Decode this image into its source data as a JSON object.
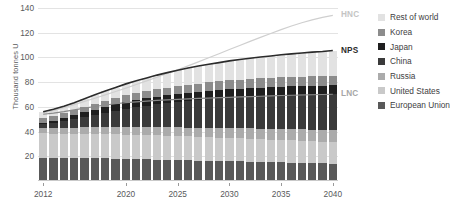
{
  "chart_data": {
    "type": "bar",
    "title": "",
    "subtitle": "",
    "xlabel": "",
    "ylabel": "Thousand tonnes U",
    "ylim": [
      0,
      140
    ],
    "ytick_values": [
      20,
      40,
      60,
      80,
      100,
      120,
      140
    ],
    "ytick_labels": [
      "20",
      "40",
      "60",
      "80",
      "100",
      "120",
      "140"
    ],
    "grid": true,
    "stacked": true,
    "legend_position": "right",
    "x": [
      2012,
      2013,
      2014,
      2015,
      2016,
      2017,
      2018,
      2019,
      2020,
      2021,
      2022,
      2023,
      2024,
      2025,
      2026,
      2027,
      2028,
      2029,
      2030,
      2031,
      2032,
      2033,
      2034,
      2035,
      2036,
      2037,
      2038,
      2039,
      2040
    ],
    "xtick_values": [
      2012,
      2020,
      2025,
      2030,
      2035,
      2040
    ],
    "xtick_labels": [
      "2012",
      "2020",
      "2025",
      "2030",
      "2035",
      "2040"
    ],
    "categories": [
      "2012",
      "2013",
      "2014",
      "2015",
      "2016",
      "2017",
      "2018",
      "2019",
      "2020",
      "2021",
      "2022",
      "2023",
      "2024",
      "2025",
      "2026",
      "2027",
      "2028",
      "2029",
      "2030",
      "2031",
      "2032",
      "2033",
      "2034",
      "2035",
      "2036",
      "2037",
      "2038",
      "2039",
      "2040"
    ],
    "series": [
      {
        "name": "European Union",
        "color": "#595959",
        "values": [
          19.0,
          18.9,
          18.8,
          18.7,
          18.6,
          18.5,
          18.4,
          18.2,
          18.0,
          17.8,
          17.6,
          17.4,
          17.2,
          17.0,
          16.8,
          16.6,
          16.4,
          16.2,
          16.0,
          15.8,
          15.6,
          15.4,
          15.2,
          15.0,
          14.8,
          14.6,
          14.4,
          14.2,
          14.0
        ]
      },
      {
        "name": "United States",
        "color": "#c9c9c9",
        "values": [
          19.5,
          19.5,
          19.5,
          19.5,
          19.6,
          19.6,
          19.6,
          19.6,
          19.6,
          19.6,
          19.5,
          19.5,
          19.4,
          19.4,
          19.3,
          19.2,
          19.1,
          19.0,
          18.9,
          18.8,
          18.6,
          18.5,
          18.3,
          18.2,
          18.0,
          17.9,
          17.7,
          17.6,
          17.4
        ]
      },
      {
        "name": "Russia",
        "color": "#ababab",
        "values": [
          4.6,
          4.7,
          4.8,
          5.0,
          5.2,
          5.4,
          5.6,
          5.8,
          6.0,
          6.2,
          6.4,
          6.6,
          6.8,
          7.0,
          7.2,
          7.4,
          7.6,
          7.8,
          8.0,
          8.2,
          8.4,
          8.6,
          8.8,
          9.0,
          9.2,
          9.4,
          9.6,
          9.8,
          10.0
        ]
      },
      {
        "name": "China",
        "color": "#3a3a3a",
        "values": [
          3.0,
          4.2,
          5.5,
          7.0,
          8.6,
          10.2,
          11.8,
          13.4,
          15.0,
          16.4,
          17.6,
          18.8,
          19.8,
          20.8,
          21.7,
          22.5,
          23.3,
          24.0,
          24.7,
          25.3,
          25.9,
          26.4,
          26.9,
          27.4,
          27.8,
          28.2,
          28.6,
          28.9,
          29.2
        ]
      },
      {
        "name": "Japan",
        "color": "#1f1f1f",
        "values": [
          1.2,
          1.6,
          2.2,
          2.9,
          3.5,
          4.1,
          4.6,
          5.0,
          5.4,
          5.7,
          5.9,
          6.1,
          6.3,
          6.4,
          6.5,
          6.6,
          6.7,
          6.7,
          6.8,
          6.8,
          6.8,
          6.8,
          6.8,
          6.8,
          6.8,
          6.8,
          6.8,
          6.8,
          6.8
        ]
      },
      {
        "name": "Korea",
        "color": "#8c8c8c",
        "values": [
          3.9,
          4.0,
          4.1,
          4.3,
          4.5,
          4.7,
          4.9,
          5.1,
          5.3,
          5.5,
          5.7,
          5.9,
          6.1,
          6.3,
          6.5,
          6.6,
          6.8,
          6.9,
          7.0,
          7.1,
          7.2,
          7.3,
          7.4,
          7.5,
          7.6,
          7.7,
          7.8,
          7.9,
          8.0
        ]
      },
      {
        "name": "Rest of world",
        "color": "#e2e2e2",
        "values": [
          4.8,
          5.1,
          5.5,
          6.0,
          6.6,
          7.2,
          7.9,
          8.6,
          9.3,
          10.0,
          10.7,
          11.4,
          12.1,
          12.8,
          13.4,
          14.0,
          14.6,
          15.2,
          15.8,
          16.3,
          16.8,
          17.3,
          17.8,
          18.3,
          18.7,
          19.1,
          19.5,
          19.9,
          20.2
        ]
      }
    ],
    "lines": [
      {
        "name": "HNC",
        "label": "HNC",
        "color": "#cfcfcf",
        "values": [
          55.0,
          57.0,
          59.3,
          61.8,
          64.4,
          67.0,
          69.7,
          72.4,
          75.2,
          78.1,
          81.0,
          84.0,
          87.0,
          90.0,
          93.2,
          96.4,
          99.7,
          103.0,
          106.4,
          109.7,
          113.0,
          116.2,
          119.4,
          122.5,
          125.4,
          128.1,
          130.4,
          132.4,
          134.0
        ]
      },
      {
        "name": "NPS",
        "label": "NPS",
        "color": "#2b2b2b",
        "values": [
          56.0,
          58.0,
          60.4,
          63.4,
          66.6,
          69.7,
          72.8,
          75.7,
          78.6,
          81.2,
          83.4,
          85.7,
          87.7,
          89.7,
          91.4,
          93.1,
          94.5,
          95.8,
          97.2,
          98.3,
          99.3,
          100.3,
          101.2,
          102.2,
          102.9,
          103.6,
          104.3,
          104.8,
          105.6
        ]
      },
      {
        "name": "LNC",
        "label": "LNC",
        "color": "#8a8a8a",
        "values": [
          54.0,
          55.0,
          56.2,
          57.6,
          59.0,
          60.3,
          61.5,
          62.5,
          63.4,
          64.1,
          64.7,
          65.2,
          65.6,
          66.0,
          66.4,
          66.8,
          67.1,
          67.4,
          67.7,
          68.0,
          68.3,
          68.6,
          68.9,
          69.2,
          69.4,
          69.6,
          69.8,
          70.0,
          70.2
        ]
      }
    ],
    "legend_entries": [
      {
        "label": "Rest of world",
        "color": "#e2e2e2"
      },
      {
        "label": "Korea",
        "color": "#8c8c8c"
      },
      {
        "label": "Japan",
        "color": "#1f1f1f"
      },
      {
        "label": "China",
        "color": "#3a3a3a"
      },
      {
        "label": "Russia",
        "color": "#ababab"
      },
      {
        "label": "United States",
        "color": "#c9c9c9"
      },
      {
        "label": "European Union",
        "color": "#595959"
      }
    ]
  }
}
